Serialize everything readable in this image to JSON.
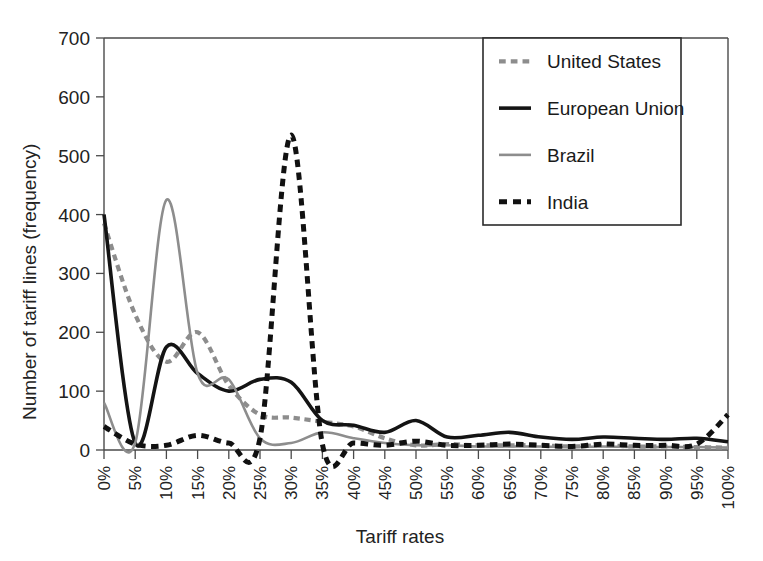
{
  "chart_data": {
    "type": "line",
    "title": "",
    "xlabel": "Tariff rates",
    "ylabel": "Number of tariff lines (frequency)",
    "xlim": [
      0,
      100
    ],
    "ylim": [
      0,
      700
    ],
    "grid": false,
    "legend_position": "top-right",
    "categories": [
      "0%",
      "5%",
      "10%",
      "15%",
      "20%",
      "25%",
      "30%",
      "35%",
      "40%",
      "45%",
      "50%",
      "55%",
      "60%",
      "65%",
      "70%",
      "75%",
      "80%",
      "85%",
      "90%",
      "95%",
      "100%"
    ],
    "x": [
      0,
      5,
      10,
      15,
      20,
      25,
      30,
      35,
      40,
      45,
      50,
      55,
      60,
      65,
      70,
      75,
      80,
      85,
      90,
      95,
      100
    ],
    "yticks": [
      0,
      100,
      200,
      300,
      400,
      500,
      600,
      700
    ],
    "series": [
      {
        "name": "United States",
        "color": "#8d8d8d",
        "style": "dashed",
        "width": 4.2,
        "values": [
          385,
          230,
          150,
          200,
          110,
          60,
          55,
          48,
          40,
          20,
          8,
          10,
          8,
          8,
          8,
          6,
          8,
          6,
          6,
          5,
          4
        ]
      },
      {
        "name": "European Union",
        "color": "#141414",
        "style": "solid",
        "width": 3.6,
        "values": [
          400,
          12,
          175,
          130,
          100,
          120,
          115,
          50,
          42,
          30,
          50,
          22,
          25,
          30,
          22,
          18,
          22,
          20,
          18,
          20,
          14
        ]
      },
      {
        "name": "Brazil",
        "color": "#8d8d8d",
        "style": "solid",
        "width": 2.6,
        "values": [
          80,
          12,
          425,
          130,
          120,
          20,
          12,
          30,
          20,
          12,
          8,
          8,
          6,
          6,
          6,
          5,
          6,
          5,
          5,
          5,
          4
        ]
      },
      {
        "name": "India",
        "color": "#111111",
        "style": "dashed",
        "width": 5.0,
        "values": [
          40,
          10,
          8,
          25,
          12,
          20,
          535,
          10,
          12,
          8,
          15,
          8,
          8,
          10,
          8,
          6,
          10,
          8,
          8,
          10,
          60
        ]
      }
    ]
  },
  "legend": {
    "items": [
      {
        "label": "United States"
      },
      {
        "label": "European Union"
      },
      {
        "label": "Brazil"
      },
      {
        "label": "India"
      }
    ]
  },
  "axes": {
    "y_title": "Number of tariff lines (frequency)",
    "x_title": "Tariff rates"
  }
}
